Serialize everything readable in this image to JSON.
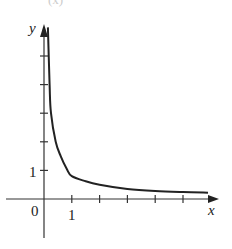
{
  "chart_data": {
    "type": "line",
    "title": "",
    "xlabel": "x",
    "ylabel": "y",
    "origin_label": "0",
    "x_tick_labels": [
      {
        "value": 1,
        "label": "1"
      }
    ],
    "y_tick_labels": [
      {
        "value": 1,
        "label": "1"
      }
    ],
    "x_ticks": [
      1,
      2,
      3,
      4,
      5
    ],
    "y_ticks": [
      1,
      2,
      3,
      4,
      5
    ],
    "xlim": [
      -1.5,
      6.2
    ],
    "ylim": [
      -1.5,
      6.1
    ],
    "grid": false,
    "legend": null,
    "series": [
      {
        "name": "curve",
        "color": "#222222",
        "points": [
          [
            0.14,
            6.0
          ],
          [
            0.2,
            4.0
          ],
          [
            0.25,
            3.0
          ],
          [
            0.42,
            2.0
          ],
          [
            0.6,
            1.5
          ],
          [
            0.82,
            1.05
          ],
          [
            1.0,
            0.8
          ],
          [
            1.5,
            0.62
          ],
          [
            2.0,
            0.5
          ],
          [
            3.0,
            0.35
          ],
          [
            4.0,
            0.28
          ],
          [
            5.0,
            0.24
          ],
          [
            5.9,
            0.22
          ]
        ]
      }
    ]
  },
  "header_fragment": "(x)"
}
